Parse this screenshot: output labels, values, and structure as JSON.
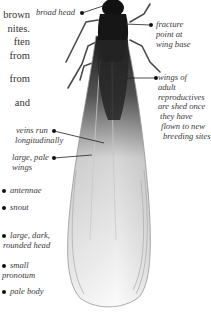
{
  "body_text": {
    "lines": [
      "brown",
      "nites.",
      "ften",
      "from",
      "",
      "from",
      "",
      "and"
    ]
  },
  "labels": {
    "broad_head": "broad head",
    "fracture": [
      "fracture",
      "point at",
      "wing base"
    ],
    "wings_shed": [
      "wings of",
      "adult",
      "reproductives",
      "are shed once",
      "they have",
      "flown to new",
      "breeding sites"
    ],
    "veins": [
      "veins run",
      "longitudinally"
    ],
    "large_pale": [
      "large, pale",
      "wings"
    ],
    "antennae": "antennae",
    "snout": "snout",
    "dark_head": [
      "large, dark,",
      "rounded head"
    ],
    "pronotum": [
      "small",
      "pronotum"
    ],
    "pale_body": "pale body"
  },
  "illustration": {
    "subject": "winged termite (alate)",
    "colors": {
      "body": "#151515",
      "wing_dark": "#3a3a3a",
      "wing_light": "#f2f2f2",
      "wing_edge": "#b8b8b8",
      "leader": "#222222"
    }
  }
}
